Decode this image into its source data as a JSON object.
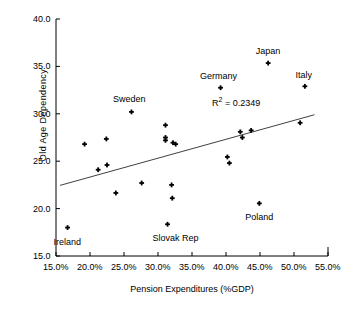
{
  "chart_data": {
    "type": "scatter",
    "title": "",
    "xlabel": "Pension Expenditures (%GDP)",
    "ylabel": "Old  Age   Dependency",
    "xlim": [
      15,
      55
    ],
    "ylim": [
      15,
      40
    ],
    "xticks": [
      "15.0%",
      "20.0%",
      "25.0%",
      "30.0%",
      "35.0%",
      "40.0%",
      "45.0%",
      "50.0%",
      "55.0%"
    ],
    "xtick_values": [
      15,
      20,
      25,
      30,
      35,
      40,
      45,
      50,
      55
    ],
    "yticks": [
      "40.0",
      "35.0",
      "30.0",
      "25.0",
      "20.0",
      "15.0"
    ],
    "ytick_values": [
      40,
      35,
      30,
      25,
      20,
      15
    ],
    "grid": false,
    "legend": "none",
    "annotation": "R² = 0.2349",
    "annotation_prefix": "R",
    "annotation_sup": "2",
    "annotation_suffix": " = 0.2349",
    "r_squared": 0.2349,
    "marker_color": "#000000",
    "line_color": "#404040",
    "axis_color": "#000000",
    "trendline": {
      "x_start": 15.6,
      "y_start": 22.45,
      "x_end": 53.0,
      "y_end": 29.9
    },
    "points": [
      {
        "label": "Ireland",
        "x": 16.7,
        "y": 18.0,
        "label_dx": 0,
        "label_dy": 14
      },
      {
        "label": "",
        "x": 19.2,
        "y": 26.8,
        "label_dx": 0,
        "label_dy": 0
      },
      {
        "label": "",
        "x": 21.2,
        "y": 24.1,
        "label_dx": 0,
        "label_dy": 0
      },
      {
        "label": "",
        "x": 22.4,
        "y": 27.35,
        "label_dx": 0,
        "label_dy": 0
      },
      {
        "label": "",
        "x": 22.5,
        "y": 24.6,
        "label_dx": 0,
        "label_dy": 0
      },
      {
        "label": "",
        "x": 23.8,
        "y": 21.65,
        "label_dx": 0,
        "label_dy": 0
      },
      {
        "label": "Sweden",
        "x": 26.1,
        "y": 30.2,
        "label_dx": -2,
        "label_dy": -13
      },
      {
        "label": "",
        "x": 27.6,
        "y": 22.7,
        "label_dx": 0,
        "label_dy": 0
      },
      {
        "label": "",
        "x": 31.1,
        "y": 28.8,
        "label_dx": 0,
        "label_dy": 0
      },
      {
        "label": "",
        "x": 31.1,
        "y": 27.5,
        "label_dx": 0,
        "label_dy": 0
      },
      {
        "label": "",
        "x": 31.1,
        "y": 27.2,
        "label_dx": 0,
        "label_dy": 0
      },
      {
        "label": "",
        "x": 32.2,
        "y": 26.95,
        "label_dx": 0,
        "label_dy": 0
      },
      {
        "label": "",
        "x": 32.6,
        "y": 26.8,
        "label_dx": 0,
        "label_dy": 0
      },
      {
        "label": "",
        "x": 32.0,
        "y": 22.5,
        "label_dx": 0,
        "label_dy": 0
      },
      {
        "label": "",
        "x": 32.1,
        "y": 21.1,
        "label_dx": 0,
        "label_dy": 0
      },
      {
        "label": "Slovak Rep",
        "x": 31.4,
        "y": 18.35,
        "label_dx": 8,
        "label_dy": 14
      },
      {
        "label": "Germany",
        "x": 39.2,
        "y": 32.75,
        "label_dx": -2,
        "label_dy": -12
      },
      {
        "label": "",
        "x": 40.2,
        "y": 25.45,
        "label_dx": 0,
        "label_dy": 0
      },
      {
        "label": "",
        "x": 40.5,
        "y": 24.8,
        "label_dx": 0,
        "label_dy": 0
      },
      {
        "label": "",
        "x": 42.1,
        "y": 28.1,
        "label_dx": 0,
        "label_dy": 0
      },
      {
        "label": "",
        "x": 42.4,
        "y": 27.5,
        "label_dx": 0,
        "label_dy": 0
      },
      {
        "label": "",
        "x": 43.7,
        "y": 28.25,
        "label_dx": 0,
        "label_dy": 0
      },
      {
        "label": "Poland",
        "x": 44.9,
        "y": 20.55,
        "label_dx": 0,
        "label_dy": 14
      },
      {
        "label": "Japan",
        "x": 46.2,
        "y": 35.35,
        "label_dx": 0,
        "label_dy": -12
      },
      {
        "label": "",
        "x": 50.9,
        "y": 29.05,
        "label_dx": 0,
        "label_dy": 0
      },
      {
        "label": "Italy",
        "x": 51.6,
        "y": 32.9,
        "label_dx": -1,
        "label_dy": -11
      }
    ]
  },
  "geometry": {
    "plot_left": 56,
    "plot_right": 328,
    "plot_top": 19,
    "plot_bottom": 256
  }
}
